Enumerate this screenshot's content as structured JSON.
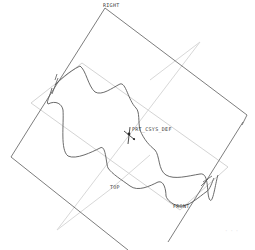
{
  "viewport": {
    "background": "#ffffff",
    "colors": {
      "datum_plane_dark": "#6e6e6e",
      "datum_plane_light": "#d4d4d4",
      "curve": "#5a5a5a",
      "label": "#3a3a3a",
      "faint_label": "#bdbdbd"
    }
  },
  "datum_planes": [
    {
      "name": "RIGHT",
      "label": "RIGHT"
    },
    {
      "name": "TOP",
      "label": "TOP"
    },
    {
      "name": "FRONT",
      "label": "FRONT"
    }
  ],
  "coordinate_system": {
    "label": "PRT_CSYS_DEF"
  },
  "labels": {
    "right": "RIGHT",
    "top": "TOP",
    "front": "FRONT",
    "csys": "PRT_CSYS_DEF",
    "corner_note": "- - -"
  }
}
